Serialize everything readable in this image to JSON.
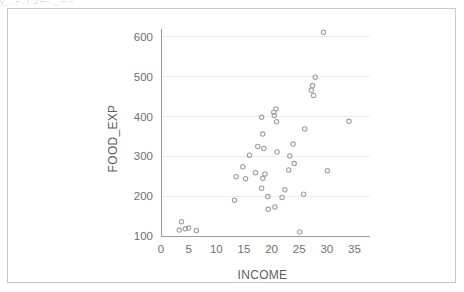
{
  "figure": {
    "top_artifact_text": "y_ ˍ ⌐ ,  ᒥ  ᒧ  ⌐¬   ˍ_  ⌐ ¬",
    "border_color": "#c9c9c9",
    "background_color": "#ffffff"
  },
  "chart_data": {
    "type": "scatter",
    "title": "",
    "subtitle": "",
    "xlabel": "INCOME",
    "ylabel": "FOOD_EXP",
    "xlim": [
      0,
      36
    ],
    "ylim": [
      100,
      620
    ],
    "xticks": [
      0,
      5,
      10,
      15,
      20,
      25,
      30,
      35
    ],
    "xtick_labels": [
      "0",
      "5",
      "10",
      "15",
      "20",
      "25",
      "30",
      "35"
    ],
    "yticks": [
      100,
      200,
      300,
      400,
      500,
      600
    ],
    "ytick_labels": [
      "100",
      "200",
      "300",
      "400",
      "500",
      "600"
    ],
    "grid": "horizontal",
    "grid_color": "#ededed",
    "axis_color": "#9a9a9a",
    "marker": {
      "shape": "circle-open",
      "color": "#a0a0a0",
      "radius": 2.2
    },
    "legend": null,
    "annotations": [],
    "points": [
      {
        "x": 3.7,
        "y": 136
      },
      {
        "x": 3.3,
        "y": 115
      },
      {
        "x": 4.4,
        "y": 118
      },
      {
        "x": 5.0,
        "y": 120
      },
      {
        "x": 6.4,
        "y": 114
      },
      {
        "x": 13.3,
        "y": 190
      },
      {
        "x": 13.6,
        "y": 249
      },
      {
        "x": 14.8,
        "y": 274
      },
      {
        "x": 15.3,
        "y": 244
      },
      {
        "x": 16.0,
        "y": 303
      },
      {
        "x": 17.5,
        "y": 325
      },
      {
        "x": 17.1,
        "y": 259
      },
      {
        "x": 18.2,
        "y": 398
      },
      {
        "x": 18.4,
        "y": 356
      },
      {
        "x": 18.6,
        "y": 320
      },
      {
        "x": 18.4,
        "y": 245
      },
      {
        "x": 18.8,
        "y": 256
      },
      {
        "x": 18.2,
        "y": 220
      },
      {
        "x": 19.3,
        "y": 199
      },
      {
        "x": 19.4,
        "y": 167
      },
      {
        "x": 20.4,
        "y": 411
      },
      {
        "x": 20.8,
        "y": 419
      },
      {
        "x": 20.5,
        "y": 403
      },
      {
        "x": 20.9,
        "y": 387
      },
      {
        "x": 21.0,
        "y": 311
      },
      {
        "x": 20.6,
        "y": 173
      },
      {
        "x": 21.9,
        "y": 197
      },
      {
        "x": 22.4,
        "y": 216
      },
      {
        "x": 23.1,
        "y": 266
      },
      {
        "x": 23.3,
        "y": 301
      },
      {
        "x": 23.9,
        "y": 331
      },
      {
        "x": 24.1,
        "y": 282
      },
      {
        "x": 25.1,
        "y": 110
      },
      {
        "x": 25.8,
        "y": 205
      },
      {
        "x": 26.0,
        "y": 369
      },
      {
        "x": 27.4,
        "y": 478
      },
      {
        "x": 27.2,
        "y": 466
      },
      {
        "x": 27.6,
        "y": 453
      },
      {
        "x": 27.9,
        "y": 499
      },
      {
        "x": 29.4,
        "y": 612
      },
      {
        "x": 30.1,
        "y": 264
      },
      {
        "x": 34.0,
        "y": 388
      }
    ]
  }
}
